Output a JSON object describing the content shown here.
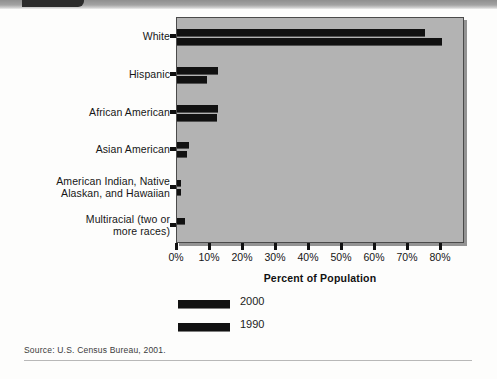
{
  "figure": {
    "source_note": "Source: U.S. Census Bureau, 2001.",
    "axis_title": "Percent of Population"
  },
  "legend": {
    "items": [
      {
        "label": "2000",
        "swatch": "legend-swatch-2000"
      },
      {
        "label": "1990",
        "swatch": "legend-swatch-1990"
      }
    ]
  },
  "chart_data": {
    "type": "bar",
    "orientation": "horizontal",
    "title": "",
    "subtitle": "",
    "xlabel": "Percent of Population",
    "ylabel": "",
    "xlim": [
      0,
      80
    ],
    "xticks": [
      0,
      10,
      20,
      30,
      40,
      50,
      60,
      70,
      80
    ],
    "xticklabels": [
      "0%",
      "10%",
      "20%",
      "30%",
      "40%",
      "50%",
      "60%",
      "70%",
      "80%"
    ],
    "grid": false,
    "legend_position": "below-axis-left",
    "categories": [
      "White",
      "Hispanic",
      "African American",
      "Asian American",
      "American Indian, Native Alaskan, and Hawaiian",
      "Multiracial (two or more races)"
    ],
    "category_labels": [
      {
        "line1": "White",
        "line2": ""
      },
      {
        "line1": "Hispanic",
        "line2": ""
      },
      {
        "line1": "African American",
        "line2": ""
      },
      {
        "line1": "Asian American",
        "line2": ""
      },
      {
        "line1": "American Indian, Native",
        "line2": "Alaskan, and Hawaiian"
      },
      {
        "line1": "Multiracial (two or",
        "line2": "more races)"
      }
    ],
    "series": [
      {
        "name": "2000",
        "values": [
          75.1,
          12.5,
          12.3,
          3.6,
          1.0,
          2.4
        ]
      },
      {
        "name": "1990",
        "values": [
          80.3,
          9.0,
          12.1,
          2.9,
          0.9,
          null
        ]
      }
    ],
    "colors": {
      "bar": "#111111",
      "plot_background": "#b3b3b3",
      "plot_border": "#4a4a4a",
      "text": "#161616"
    },
    "annotations": [
      "Multiracial category has no 1990 value (not collected in 1990 census)."
    ]
  }
}
